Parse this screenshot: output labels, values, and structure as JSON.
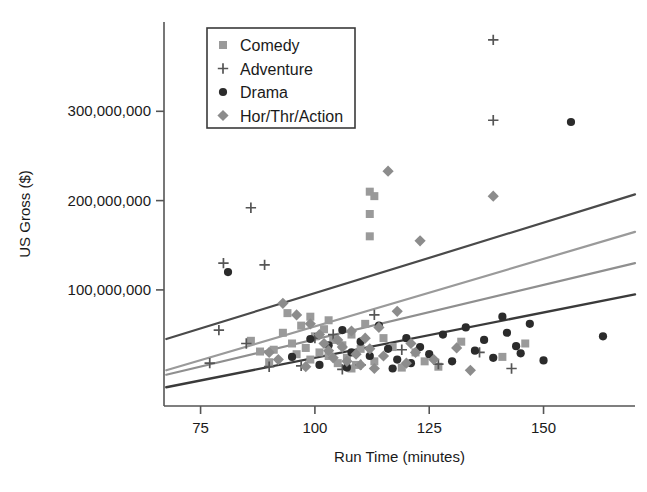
{
  "chart_data": {
    "type": "scatter",
    "title": "",
    "xlabel": "Run Time (minutes)",
    "ylabel": "US Gross ($)",
    "xlim": [
      67,
      170
    ],
    "ylim": [
      -30000000,
      400000000
    ],
    "xticks": [
      75,
      100,
      125,
      150
    ],
    "xtick_labels": [
      "75",
      "100",
      "125",
      "150"
    ],
    "yticks": [
      100000000,
      200000000,
      300000000
    ],
    "ytick_labels": [
      "100,000,000",
      "200,000,000",
      "300,000,000"
    ],
    "grid": false,
    "legend_position": "upper-left",
    "legend_entries": [
      {
        "label": "Comedy",
        "marker": "square",
        "color": "#9a9a9a"
      },
      {
        "label": "Adventure",
        "marker": "plus",
        "color": "#555555"
      },
      {
        "label": "Drama",
        "marker": "circle",
        "color": "#2b2b2b"
      },
      {
        "label": "Hor/Thr/Action",
        "marker": "diamond",
        "color": "#8c8c8c"
      }
    ],
    "series": [
      {
        "name": "Comedy",
        "marker": "square",
        "color": "#9a9a9a",
        "points": [
          [
            86,
            43000000
          ],
          [
            91,
            33000000
          ],
          [
            93,
            52000000
          ],
          [
            95,
            40000000
          ],
          [
            96,
            28000000
          ],
          [
            97,
            60000000
          ],
          [
            98,
            35000000
          ],
          [
            99,
            22000000
          ],
          [
            100,
            48000000
          ],
          [
            101,
            30000000
          ],
          [
            102,
            56000000
          ],
          [
            103,
            26000000
          ],
          [
            104,
            44000000
          ],
          [
            105,
            18000000
          ],
          [
            106,
            38000000
          ],
          [
            107,
            24000000
          ],
          [
            108,
            50000000
          ],
          [
            109,
            16000000
          ],
          [
            110,
            34000000
          ],
          [
            111,
            62000000
          ],
          [
            112,
            210000000
          ],
          [
            112,
            185000000
          ],
          [
            112,
            160000000
          ],
          [
            113,
            205000000
          ],
          [
            94,
            74000000
          ],
          [
            99,
            70000000
          ],
          [
            103,
            66000000
          ],
          [
            108,
            12000000
          ],
          [
            113,
            20000000
          ],
          [
            117,
            36000000
          ],
          [
            122,
            30000000
          ],
          [
            127,
            14000000
          ],
          [
            132,
            42000000
          ],
          [
            141,
            25000000
          ],
          [
            146,
            40000000
          ],
          [
            90,
            19000000
          ],
          [
            88,
            31000000
          ],
          [
            115,
            46000000
          ],
          [
            119,
            13000000
          ],
          [
            124,
            20000000
          ]
        ]
      },
      {
        "name": "Adventure",
        "marker": "plus",
        "color": "#555555",
        "points": [
          [
            139,
            380000000
          ],
          [
            139,
            290000000
          ],
          [
            86,
            192000000
          ],
          [
            80,
            130000000
          ],
          [
            89,
            128000000
          ],
          [
            79,
            55000000
          ],
          [
            85,
            40000000
          ],
          [
            77,
            18000000
          ],
          [
            90,
            14000000
          ],
          [
            97,
            15000000
          ],
          [
            104,
            50000000
          ],
          [
            110,
            16000000
          ],
          [
            113,
            72000000
          ],
          [
            119,
            33000000
          ],
          [
            127,
            17000000
          ],
          [
            136,
            30000000
          ],
          [
            143,
            12000000
          ],
          [
            106,
            11000000
          ],
          [
            100,
            46000000
          ]
        ]
      },
      {
        "name": "Drama",
        "marker": "circle",
        "color": "#2b2b2b",
        "points": [
          [
            156,
            288000000
          ],
          [
            81,
            120000000
          ],
          [
            99,
            45000000
          ],
          [
            103,
            38000000
          ],
          [
            106,
            55000000
          ],
          [
            108,
            30000000
          ],
          [
            110,
            42000000
          ],
          [
            112,
            26000000
          ],
          [
            114,
            60000000
          ],
          [
            116,
            34000000
          ],
          [
            118,
            22000000
          ],
          [
            120,
            46000000
          ],
          [
            121,
            18000000
          ],
          [
            123,
            36000000
          ],
          [
            125,
            28000000
          ],
          [
            128,
            50000000
          ],
          [
            130,
            20000000
          ],
          [
            133,
            58000000
          ],
          [
            135,
            32000000
          ],
          [
            137,
            44000000
          ],
          [
            139,
            24000000
          ],
          [
            141,
            70000000
          ],
          [
            142,
            52000000
          ],
          [
            144,
            37000000
          ],
          [
            145,
            29000000
          ],
          [
            147,
            62000000
          ],
          [
            150,
            21000000
          ],
          [
            163,
            48000000
          ],
          [
            95,
            25000000
          ],
          [
            101,
            16000000
          ],
          [
            107,
            13000000
          ],
          [
            117,
            12000000
          ]
        ]
      },
      {
        "name": "Hor/Thr/Action",
        "marker": "diamond",
        "color": "#8c8c8c",
        "points": [
          [
            116,
            233000000
          ],
          [
            139,
            205000000
          ],
          [
            123,
            155000000
          ],
          [
            93,
            85000000
          ],
          [
            96,
            72000000
          ],
          [
            99,
            62000000
          ],
          [
            101,
            50000000
          ],
          [
            102,
            40000000
          ],
          [
            103,
            32000000
          ],
          [
            104,
            24000000
          ],
          [
            105,
            44000000
          ],
          [
            106,
            36000000
          ],
          [
            107,
            20000000
          ],
          [
            108,
            54000000
          ],
          [
            109,
            28000000
          ],
          [
            110,
            16000000
          ],
          [
            111,
            46000000
          ],
          [
            112,
            34000000
          ],
          [
            113,
            12000000
          ],
          [
            114,
            58000000
          ],
          [
            115,
            26000000
          ],
          [
            118,
            76000000
          ],
          [
            120,
            18000000
          ],
          [
            121,
            40000000
          ],
          [
            126,
            22000000
          ],
          [
            131,
            35000000
          ],
          [
            134,
            10000000
          ],
          [
            98,
            14000000
          ],
          [
            92,
            22000000
          ],
          [
            90,
            30000000
          ],
          [
            122,
            30000000
          ]
        ]
      }
    ],
    "trend_lines": [
      {
        "name": "Adventure-fit",
        "color": "#4a4a4a",
        "width": 2.2,
        "x0": 67.5,
        "y0": 45000000,
        "x1": 170,
        "y1": 207000000
      },
      {
        "name": "Comedy-fit",
        "color": "#9a9a9a",
        "width": 2.2,
        "x0": 67.5,
        "y0": 10000000,
        "x1": 170,
        "y1": 165000000
      },
      {
        "name": "Hor-Thr-Action-fit",
        "color": "#8f8f8f",
        "width": 2.2,
        "x0": 67.5,
        "y0": 5000000,
        "x1": 170,
        "y1": 130000000
      },
      {
        "name": "Drama-fit",
        "color": "#3a3a3a",
        "width": 2.4,
        "x0": 67.5,
        "y0": -9000000,
        "x1": 170,
        "y1": 95000000
      }
    ]
  }
}
